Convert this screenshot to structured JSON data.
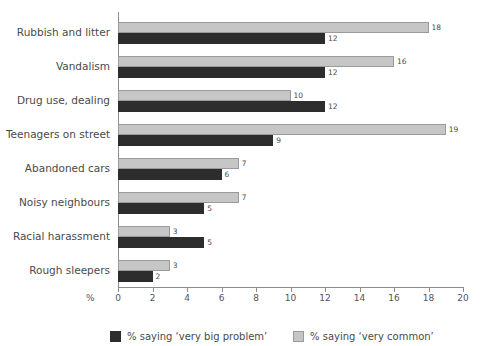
{
  "chart_data": {
    "type": "bar",
    "orientation": "horizontal",
    "title": "",
    "xlabel": "%",
    "ylabel": "",
    "xlim": [
      0,
      20
    ],
    "xticks": [
      0,
      2,
      4,
      6,
      8,
      10,
      12,
      14,
      16,
      18,
      20
    ],
    "grid": false,
    "legend_position": "bottom",
    "categories": [
      "Rubbish and litter",
      "Vandalism",
      "Drug use, dealing",
      "Teenagers on street",
      "Abandoned cars",
      "Noisy neighbours",
      "Racial harassment",
      "Rough sleepers"
    ],
    "series": [
      {
        "name": "% saying ‘very common’",
        "color": "#c6c6c6",
        "values": [
          18,
          16,
          10,
          19,
          7,
          7,
          3,
          3
        ]
      },
      {
        "name": "% saying ‘very big problem’",
        "color": "#2d2d2d",
        "values": [
          12,
          12,
          12,
          9,
          6,
          5,
          5,
          2
        ]
      }
    ]
  },
  "axis": {
    "unit_label": "%",
    "tick_labels": [
      "0",
      "2",
      "4",
      "6",
      "8",
      "10",
      "12",
      "14",
      "16",
      "18",
      "20"
    ]
  },
  "legend": {
    "items": [
      {
        "label": "% saying ‘very big problem’",
        "swatch": "dark"
      },
      {
        "label": "% saying ‘very common’",
        "swatch": "light"
      }
    ]
  }
}
